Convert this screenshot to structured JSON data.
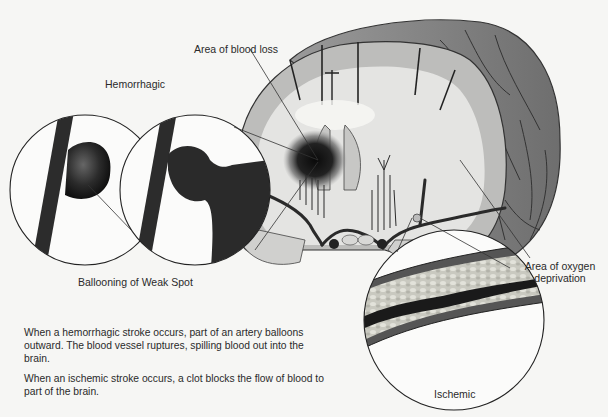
{
  "labels": {
    "area_blood_loss": "Area of blood loss",
    "hemorrhagic": "Hemorrhagic",
    "ballooning": "Ballooning of Weak Spot",
    "oxygen_deprivation_line1": "Area of oxygen",
    "oxygen_deprivation_line2": "deprivation",
    "ischemic": "Ischemic"
  },
  "paragraphs": {
    "hemorrhagic_description": "When a hemorrhagic stroke occurs, part of an artery balloons outward.  The blood vessel ruptures, spilling blood out into the brain.",
    "ischemic_description": "When an ischemic stroke occurs, a clot blocks the flow of blood to part of the brain."
  },
  "colors": {
    "background": "#f6f6f4",
    "brain_outer": "#8a8a8a",
    "brain_white_matter": "#e4e4e2",
    "brain_gray_matter": "#bdbdbb",
    "vessel": "#2a2a2a",
    "blood_loss": "#111111",
    "plaque": "#cfcfc6"
  }
}
